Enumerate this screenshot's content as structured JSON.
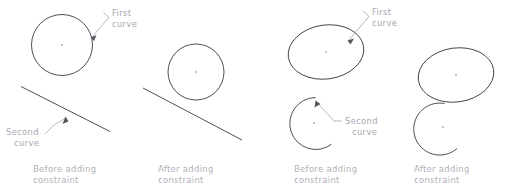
{
  "figure": {
    "background_color": "#ffffff",
    "geometry_color": "#3a3a44",
    "label_color": "#a8a8b0",
    "leader_color": "#9a9aa4",
    "width": 509,
    "height": 195
  },
  "panels": [
    {
      "id": "panel-1",
      "caption_line1": "Before adding",
      "caption_line2": "constraint",
      "annotations": [
        {
          "id": "first-curve",
          "line1": "First",
          "line2": "curve"
        },
        {
          "id": "second-curve",
          "line1": "Second",
          "line2": "curve"
        }
      ],
      "shapes": [
        {
          "name": "first-curve-circle",
          "type": "circle"
        },
        {
          "name": "second-curve-line",
          "type": "line"
        }
      ]
    },
    {
      "id": "panel-2",
      "caption_line1": "After adding",
      "caption_line2": "constraint",
      "annotations": [],
      "shapes": [
        {
          "name": "first-curve-circle",
          "type": "circle"
        },
        {
          "name": "second-curve-line",
          "type": "line"
        }
      ]
    },
    {
      "id": "panel-3",
      "caption_line1": "Before adding",
      "caption_line2": "constraint",
      "annotations": [
        {
          "id": "first-curve",
          "line1": "First",
          "line2": "curve"
        },
        {
          "id": "second-curve",
          "line1": "Second",
          "line2": "curve"
        }
      ],
      "shapes": [
        {
          "name": "first-curve-ellipse",
          "type": "ellipse"
        },
        {
          "name": "second-curve-arc",
          "type": "arc"
        }
      ]
    },
    {
      "id": "panel-4",
      "caption_line1": "After adding",
      "caption_line2": "constraint",
      "annotations": [],
      "shapes": [
        {
          "name": "first-curve-ellipse",
          "type": "ellipse"
        },
        {
          "name": "second-curve-arc",
          "type": "arc"
        }
      ]
    }
  ]
}
